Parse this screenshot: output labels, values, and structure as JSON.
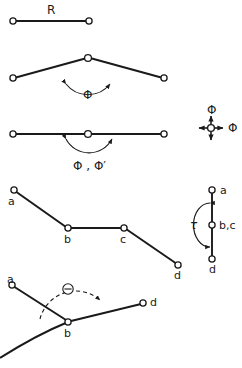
{
  "figure": {
    "background_color": "#ffffff",
    "stroke_color": "#1a1a1a",
    "node_fill_color": "#ffffff"
  },
  "panels": [
    {
      "id": "bond-length",
      "name": "bond-length-panel",
      "labels": {
        "parameter": "R"
      },
      "description": "Two atoms joined by a single bond labelled R"
    },
    {
      "id": "bond-angle",
      "name": "bond-angle-panel",
      "labels": {
        "parameter": "Φ"
      },
      "description": "Three atoms forming a bent angle with arc labelled Phi"
    },
    {
      "id": "linear-angle",
      "name": "linear-angle-panel",
      "labels": {
        "parameter": "Φ , Φ′"
      },
      "description": "Three collinear atoms with arc labelled Phi, Phi-prime"
    },
    {
      "id": "degenerate-bend",
      "name": "degenerate-bend-panel",
      "labels": {
        "vertical": "Φ",
        "horizontal": "Φ"
      },
      "description": "Central atom with four arrows showing degenerate bending directions"
    },
    {
      "id": "torsion-chain",
      "name": "torsion-chain-panel",
      "labels": {
        "a": "a",
        "b": "b",
        "c": "c",
        "d": "d"
      },
      "description": "Four atom chain a-b-c-d defining a torsion"
    },
    {
      "id": "newman-projection",
      "name": "newman-projection-panel",
      "labels": {
        "a": "a",
        "bc": "b,c",
        "d": "d",
        "parameter": "τ"
      },
      "description": "Newman projection down the b-c bond with torsion angle tau"
    },
    {
      "id": "out-of-plane",
      "name": "out-of-plane-panel",
      "labels": {
        "a": "a",
        "b": "b",
        "d": "d",
        "parameter": "Θ"
      },
      "description": "Atom b with substituents a and d and out-of-plane angle Theta"
    }
  ]
}
